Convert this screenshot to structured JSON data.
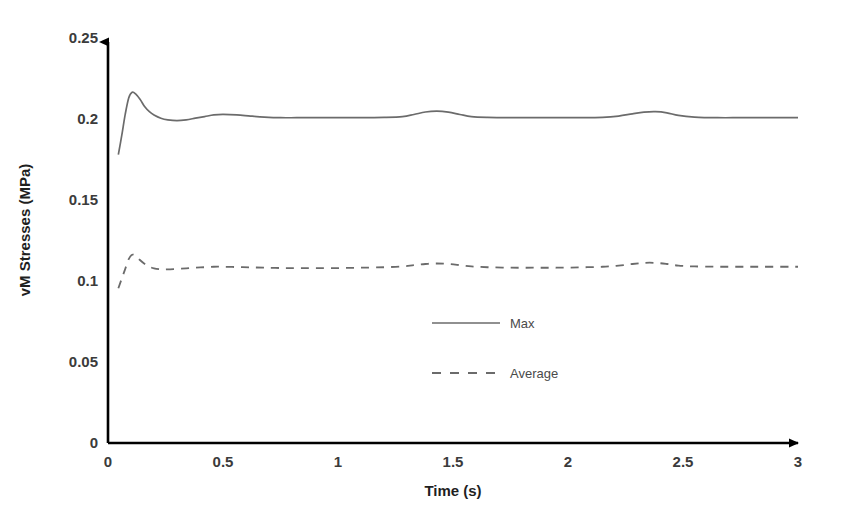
{
  "chart_data": {
    "type": "line",
    "title": "",
    "xlabel": "Time (s)",
    "ylabel": "vM Stresses (MPa)",
    "xlim": [
      0,
      3
    ],
    "ylim": [
      0,
      0.25
    ],
    "grid": false,
    "legend_position": "center",
    "x_ticks": [
      "0",
      "0.5",
      "1",
      "1.5",
      "2",
      "2.5",
      "3"
    ],
    "x_tick_values": [
      0,
      0.5,
      1,
      1.5,
      2,
      2.5,
      3
    ],
    "y_ticks": [
      "0",
      "0.05",
      "0.1",
      "0.15",
      "0.2",
      "0.25"
    ],
    "y_tick_values": [
      0,
      0.05,
      0.1,
      0.15,
      0.2,
      0.25
    ],
    "series": [
      {
        "name": "Max",
        "style": "solid",
        "color": "#6b6b6b",
        "x": [
          0.045,
          0.06,
          0.075,
          0.09,
          0.105,
          0.12,
          0.14,
          0.16,
          0.18,
          0.2,
          0.23,
          0.26,
          0.3,
          0.34,
          0.38,
          0.42,
          0.46,
          0.5,
          0.56,
          0.62,
          0.68,
          0.75,
          0.82,
          0.9,
          1.0,
          1.1,
          1.2,
          1.28,
          1.33,
          1.38,
          1.43,
          1.48,
          1.53,
          1.58,
          1.65,
          1.75,
          1.85,
          1.95,
          2.05,
          2.15,
          2.22,
          2.28,
          2.33,
          2.38,
          2.43,
          2.48,
          2.55,
          2.65,
          2.75,
          2.85,
          3.0
        ],
        "y": [
          0.178,
          0.19,
          0.203,
          0.213,
          0.2165,
          0.2155,
          0.212,
          0.2075,
          0.2045,
          0.2025,
          0.2005,
          0.1995,
          0.199,
          0.1995,
          0.2005,
          0.2015,
          0.2025,
          0.2028,
          0.2025,
          0.2018,
          0.2012,
          0.2008,
          0.2008,
          0.2008,
          0.2008,
          0.2008,
          0.201,
          0.2015,
          0.2028,
          0.2043,
          0.2048,
          0.2042,
          0.2028,
          0.2015,
          0.201,
          0.2008,
          0.2008,
          0.2008,
          0.2008,
          0.201,
          0.2018,
          0.2032,
          0.2042,
          0.2045,
          0.2038,
          0.2022,
          0.2012,
          0.2008,
          0.2008,
          0.2008,
          0.2008
        ]
      },
      {
        "name": "Average",
        "style": "dashed",
        "color": "#6b6b6b",
        "x": [
          0.045,
          0.06,
          0.075,
          0.09,
          0.105,
          0.12,
          0.14,
          0.16,
          0.18,
          0.2,
          0.23,
          0.26,
          0.3,
          0.34,
          0.38,
          0.42,
          0.46,
          0.5,
          0.56,
          0.62,
          0.68,
          0.75,
          0.82,
          0.9,
          1.0,
          1.1,
          1.2,
          1.28,
          1.33,
          1.38,
          1.43,
          1.48,
          1.53,
          1.58,
          1.65,
          1.75,
          1.85,
          1.95,
          2.05,
          2.15,
          2.22,
          2.28,
          2.33,
          2.38,
          2.43,
          2.48,
          2.55,
          2.65,
          2.75,
          2.85,
          3.0
        ],
        "y": [
          0.0955,
          0.1015,
          0.1075,
          0.1135,
          0.1162,
          0.1155,
          0.1128,
          0.1105,
          0.1088,
          0.1078,
          0.1072,
          0.1072,
          0.1075,
          0.1078,
          0.1082,
          0.1085,
          0.1088,
          0.1088,
          0.1086,
          0.1084,
          0.1082,
          0.108,
          0.108,
          0.108,
          0.108,
          0.1082,
          0.1085,
          0.109,
          0.1098,
          0.1105,
          0.1108,
          0.1105,
          0.1098,
          0.109,
          0.1085,
          0.1082,
          0.1082,
          0.1082,
          0.1084,
          0.1088,
          0.1095,
          0.1105,
          0.1112,
          0.1112,
          0.1105,
          0.1095,
          0.109,
          0.1088,
          0.1088,
          0.1088,
          0.1088
        ]
      }
    ],
    "legend": [
      {
        "label": "Max",
        "style": "solid"
      },
      {
        "label": "Average",
        "style": "dashed"
      }
    ],
    "axis_color": "#000000",
    "series_color": "#6b6b6b"
  }
}
